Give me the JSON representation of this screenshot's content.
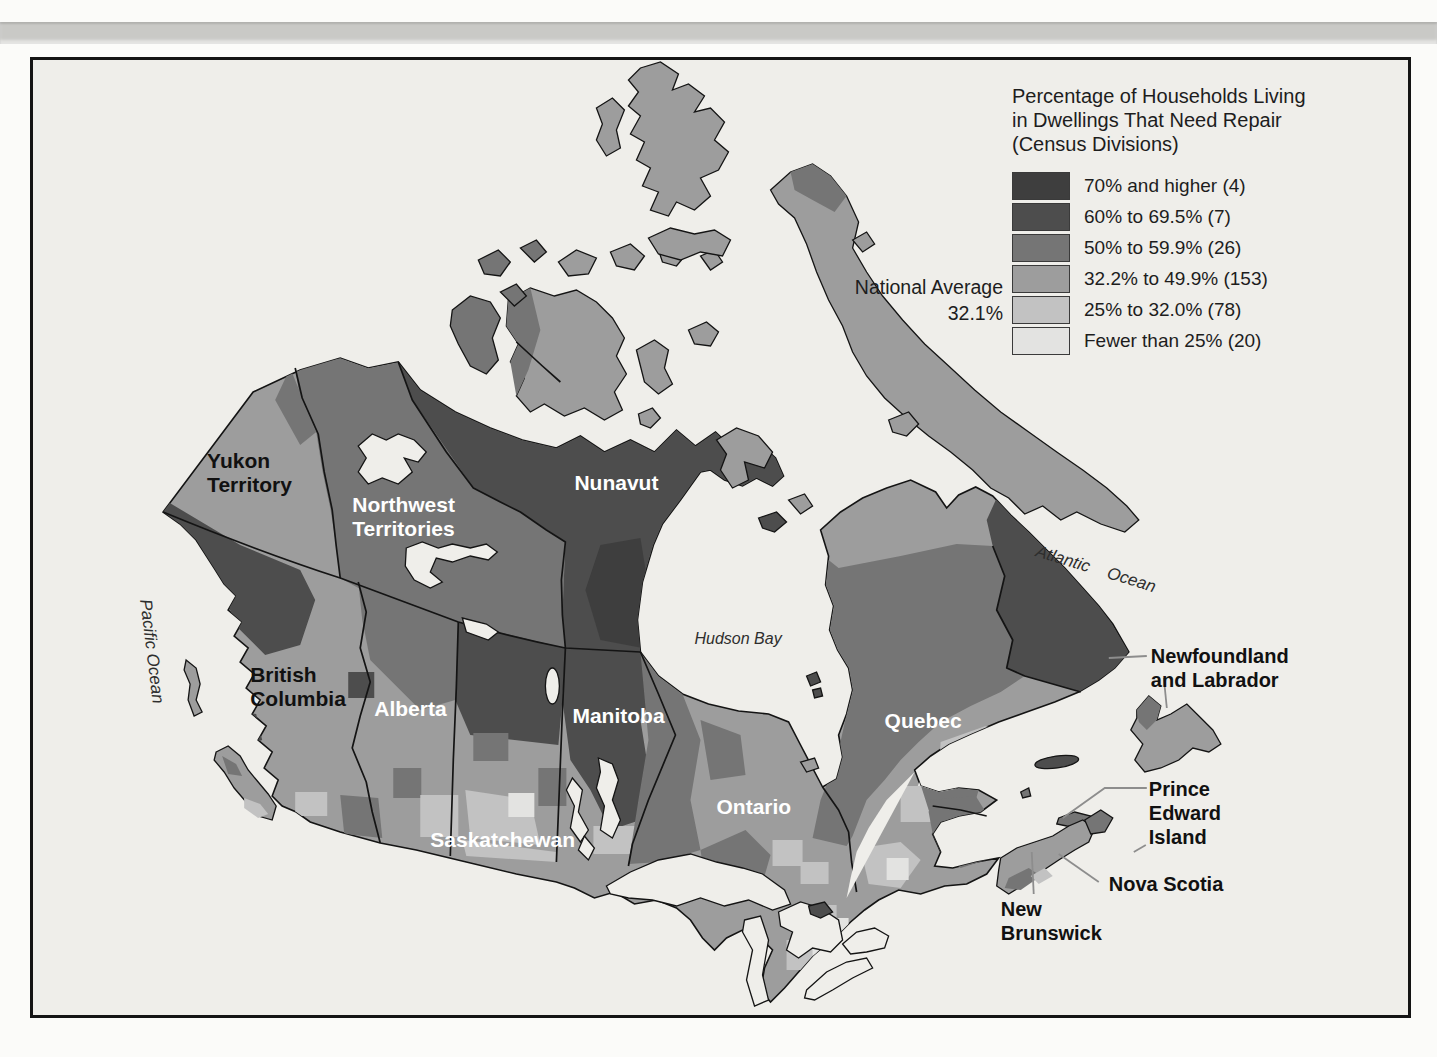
{
  "figure": {
    "legend": {
      "title_lines": [
        "Percentage of Households Living",
        "in Dwellings That Need Repair",
        "(Census Divisions)"
      ],
      "national_average": {
        "label": "National Average",
        "value": "32.1%"
      },
      "classes": [
        {
          "label": "70% and higher (4)",
          "color": "#3e3e3e"
        },
        {
          "label": "60% to 69.5% (7)",
          "color": "#4d4d4d"
        },
        {
          "label": "50% to 59.9% (26)",
          "color": "#757575"
        },
        {
          "label": "32.2% to 49.9% (153)",
          "color": "#9d9d9d"
        },
        {
          "label": "25% to 32.0% (78)",
          "color": "#c2c2c2"
        },
        {
          "label": "Fewer than 25% (20)",
          "color": "#e3e3e1"
        }
      ]
    },
    "map": {
      "colors": {
        "ocean": "#efeeea",
        "outline": "#141414",
        "label_light": "#ffffff",
        "label_dark": "#111111"
      },
      "provinces": {
        "yukon": {
          "line1": "Yukon",
          "line2": "Territory"
        },
        "nwt": {
          "line1": "Northwest",
          "line2": "Territories"
        },
        "nunavut": {
          "line1": "Nunavut"
        },
        "bc": {
          "line1": "British",
          "line2": "Columbia"
        },
        "alberta": {
          "line1": "Alberta"
        },
        "saskatchewan": {
          "line1": "Saskatchewan"
        },
        "manitoba": {
          "line1": "Manitoba"
        },
        "ontario": {
          "line1": "Ontario"
        },
        "quebec": {
          "line1": "Quebec"
        },
        "newfoundland": {
          "line1": "Newfoundland",
          "line2": "and Labrador"
        },
        "pei": {
          "line1": "Prince",
          "line2": "Edward",
          "line3": "Island"
        },
        "nova_scotia": {
          "line1": "Nova Scotia"
        },
        "new_brunswick": {
          "line1": "New",
          "line2": "Brunswick"
        }
      },
      "water": {
        "pacific": "Pacific Ocean",
        "atlantic": "Atlantic Ocean",
        "hudson": "Hudson Bay"
      }
    }
  },
  "chart_data": {
    "type": "choropleth-map",
    "title": "Percentage of Households Living in Dwellings That Need Repair (Census Divisions)",
    "national_average_pct": 32.1,
    "bins": [
      {
        "range": "70% and higher",
        "census_divisions": 4
      },
      {
        "range": "60% to 69.5%",
        "census_divisions": 7
      },
      {
        "range": "50% to 59.9%",
        "census_divisions": 26
      },
      {
        "range": "32.2% to 49.9%",
        "census_divisions": 153
      },
      {
        "range": "25% to 32.0%",
        "census_divisions": 78
      },
      {
        "range": "Fewer than 25%",
        "census_divisions": 20
      }
    ],
    "legend_position": "top-right"
  }
}
